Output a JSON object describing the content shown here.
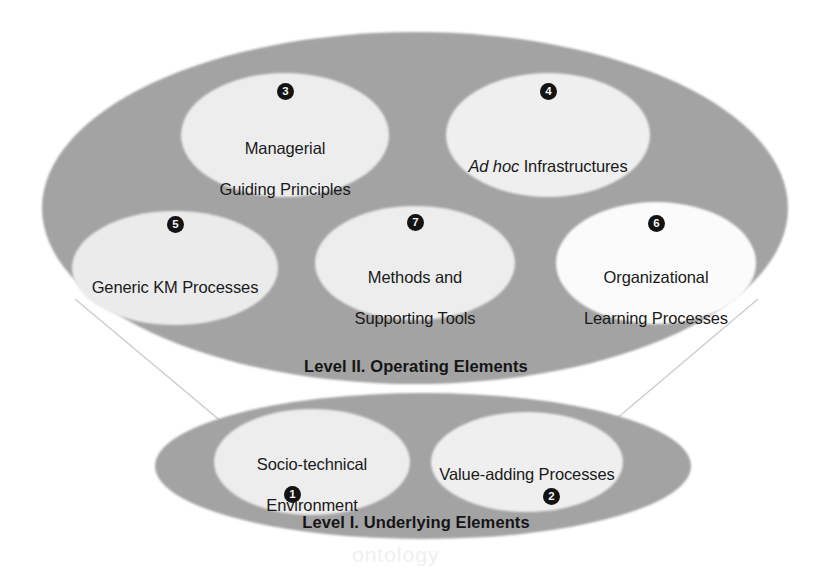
{
  "diagram": {
    "type": "nested-ellipse-diagram",
    "colors": {
      "background": "#ffffff",
      "level_fill": "#a3a3a3",
      "node_fill": "#eeeeee",
      "node_fill_bright": "#fbfbfb",
      "connector_line": "#c9c9c9",
      "text": "#1a1a1a",
      "badge_fill": "#131313",
      "badge_text": "#f2f2f2"
    },
    "levels": [
      {
        "id": "level-2",
        "label": "Level II. Operating Elements",
        "nodes": [
          {
            "number": "3",
            "line1": "Managerial",
            "line2": "Guiding Principles",
            "italic_prefix": ""
          },
          {
            "number": "4",
            "line1": "Ad hoc Infrastructures",
            "line2": "",
            "italic_prefix": "Ad hoc"
          },
          {
            "number": "5",
            "line1": "Generic KM Processes",
            "line2": "",
            "italic_prefix": ""
          },
          {
            "number": "7",
            "line1": "Methods and",
            "line2": "Supporting Tools",
            "italic_prefix": ""
          },
          {
            "number": "6",
            "line1": "Organizational",
            "line2": "Learning Processes",
            "italic_prefix": ""
          }
        ]
      },
      {
        "id": "level-1",
        "label": "Level I. Underlying Elements",
        "nodes": [
          {
            "number": "1",
            "line1": "Socio-technical",
            "line2": "Environment",
            "italic_prefix": ""
          },
          {
            "number": "2",
            "line1": "Value-adding Processes",
            "line2": "",
            "italic_prefix": ""
          }
        ]
      }
    ],
    "node_text": {
      "managerial_l1": "Managerial",
      "managerial_l2": "Guiding Principles",
      "adhoc_italic": "Ad hoc",
      "adhoc_rest": " Infrastructures",
      "generic_km": "Generic KM Processes",
      "methods_l1": "Methods and",
      "methods_l2": "Supporting Tools",
      "org_learn_l1": "Organizational",
      "org_learn_l2": "Learning Processes",
      "socio_l1": "Socio-technical",
      "socio_l2": "Environment",
      "value_adding": "Value-adding Processes"
    },
    "badges": {
      "n1": "1",
      "n2": "2",
      "n3": "3",
      "n4": "4",
      "n5": "5",
      "n6": "6",
      "n7": "7"
    },
    "level_labels": {
      "level2": "Level II. Operating Elements",
      "level1": "Level I. Underlying Elements"
    },
    "watermark": "ontology"
  }
}
